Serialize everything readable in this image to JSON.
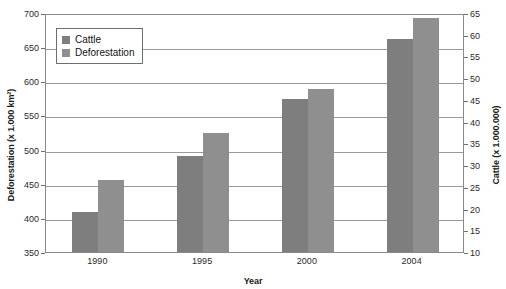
{
  "chart_data": {
    "type": "bar",
    "title": "",
    "xlabel": "Year",
    "categories": [
      "1990",
      "1995",
      "2000",
      "2004"
    ],
    "series": [
      {
        "name": "Cattle",
        "axis": "right",
        "unit": "x 1.000.000",
        "values": [
          26.5,
          38.5,
          49.5,
          60.0
        ],
        "color": "#7e7e7e"
      },
      {
        "name": "Deforestation",
        "axis": "left",
        "unit": "x 1.000 km²",
        "values": [
          456,
          524,
          588,
          693
        ],
        "color": "#8f8f8f"
      }
    ],
    "left_axis": {
      "label": "Deforestation (x 1.000 km²)",
      "ylim": [
        350,
        700
      ],
      "ticks": [
        350,
        400,
        450,
        500,
        550,
        600,
        650,
        700
      ]
    },
    "right_axis": {
      "label": "Cattle (x 1.000.000)",
      "ylim": [
        10,
        65
      ],
      "ticks": [
        10,
        15,
        20,
        25,
        30,
        35,
        40,
        45,
        50,
        55,
        60,
        65
      ]
    },
    "bar_tops_left_scale": {
      "cattle": [
        408,
        491,
        574,
        662
      ],
      "deforestation": [
        456,
        524,
        588,
        693
      ]
    },
    "grid": true,
    "legend_position": "top-left"
  },
  "legend": {
    "items": [
      {
        "label": "Cattle",
        "color": "#7e7e7e"
      },
      {
        "label": "Deforestation",
        "color": "#8f8f8f"
      }
    ]
  }
}
